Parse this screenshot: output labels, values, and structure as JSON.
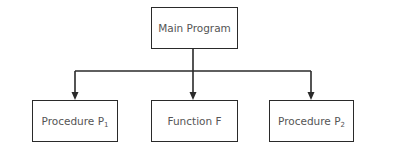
{
  "diagram": {
    "type": "hierarchy",
    "line_color": "#2a2a2a",
    "text_color": "#555555",
    "root": {
      "label": "Main Program"
    },
    "children": [
      {
        "label": "Procedure P",
        "subscript": "1"
      },
      {
        "label": "Function F",
        "subscript": ""
      },
      {
        "label": "Procedure P",
        "subscript": "2"
      }
    ],
    "edges": [
      {
        "from": "Main Program",
        "to": "Procedure P1"
      },
      {
        "from": "Main Program",
        "to": "Function F"
      },
      {
        "from": "Main Program",
        "to": "Procedure P2"
      }
    ]
  }
}
